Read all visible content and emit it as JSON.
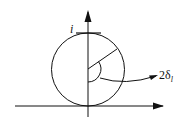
{
  "diagram": {
    "type": "geometry",
    "labels": {
      "point_i": "i",
      "angle_label_main": "2δ",
      "angle_label_sub": "l"
    },
    "colors": {
      "stroke": "#111111",
      "background": "#ffffff"
    },
    "elements": {
      "vertical_axis": "arrow pointing up",
      "horizontal_axis": "arrow pointing right",
      "circle": "circle tangent to horizontal axis, centered on vertical axis",
      "tangent_line": "short horizontal line at top of circle labeled i",
      "radius_line": "line from center to upper-right of circle",
      "angle_arc": "arc marking angle between downward vertical and radius",
      "pointer_arrow": "curved arrow from angle arc to label 2δ_l"
    }
  }
}
